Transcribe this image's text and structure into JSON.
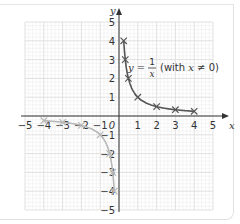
{
  "chart_data": {
    "type": "line",
    "title": "",
    "xlabel": "x",
    "ylabel": "y",
    "xlim": [
      -5,
      5
    ],
    "ylim": [
      -5,
      5
    ],
    "grid": true,
    "x_ticks": [
      -5,
      -4,
      -3,
      -2,
      -1,
      1,
      2,
      3,
      4,
      5
    ],
    "y_ticks": [
      -5,
      -4,
      -3,
      -2,
      -1,
      1,
      2,
      3,
      4,
      5
    ],
    "origin_label": "0",
    "annotation": {
      "text_lhs": "y =",
      "fraction_numerator": "1",
      "fraction_denominator": "x",
      "condition": "(with x ≠ 0)",
      "full_text": "y = 1/x (with x ≠ 0)"
    },
    "series": [
      {
        "name": "y = 1/x (x > 0)",
        "color": "#555555",
        "marker": "x",
        "points": [
          [
            0.25,
            4
          ],
          [
            0.333,
            3
          ],
          [
            0.5,
            2
          ],
          [
            1,
            1
          ],
          [
            2,
            0.5
          ],
          [
            3,
            0.333
          ],
          [
            4,
            0.25
          ]
        ]
      },
      {
        "name": "y = 1/x (x < 0)",
        "color": "#b8b8b8",
        "marker": "x",
        "points": [
          [
            -4,
            -0.25
          ],
          [
            -3,
            -0.333
          ],
          [
            -2,
            -0.5
          ],
          [
            -1,
            -1
          ],
          [
            -0.5,
            -2
          ],
          [
            -0.333,
            -3
          ],
          [
            -0.25,
            -4
          ]
        ]
      }
    ]
  },
  "labels": {
    "x_axis": "x",
    "y_axis": "y",
    "origin": "0",
    "eq_lhs": "y =",
    "eq_num": "1",
    "eq_den": "x",
    "eq_cond_pre": "(with ",
    "eq_cond_x": "x",
    "eq_cond_post": " ≠ 0)"
  },
  "colors": {
    "positive_branch": "#555555",
    "negative_branch": "#b8b8b8",
    "grid_major": "#d9d9d9",
    "grid_minor": "#efefef",
    "axis": "#333333"
  }
}
